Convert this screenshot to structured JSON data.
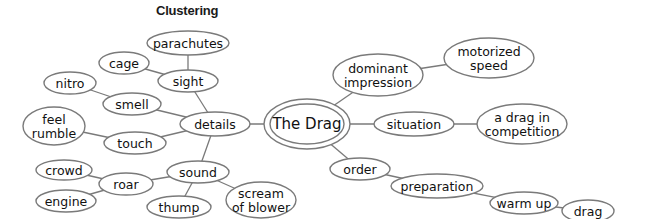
{
  "title": "Clustering",
  "center": {
    "id": "the-drag",
    "label": "The Drag",
    "cx": 307,
    "cy": 124,
    "rx": 43,
    "ry": 25,
    "inner_rx": 37,
    "inner_ry": 20
  },
  "colors": {
    "stroke": "#7a7a7a",
    "text": "#111111",
    "background": "#ffffff"
  },
  "nodes": [
    {
      "id": "details",
      "lines": [
        "details"
      ],
      "cx": 215,
      "cy": 124,
      "rx": 35,
      "ry": 12
    },
    {
      "id": "sight",
      "lines": [
        "sight"
      ],
      "cx": 188,
      "cy": 81,
      "rx": 30,
      "ry": 11
    },
    {
      "id": "parachutes",
      "lines": [
        "parachutes"
      ],
      "cx": 188,
      "cy": 43,
      "rx": 41,
      "ry": 12
    },
    {
      "id": "cage",
      "lines": [
        "cage"
      ],
      "cx": 124,
      "cy": 63,
      "rx": 25,
      "ry": 11
    },
    {
      "id": "smell",
      "lines": [
        "smell"
      ],
      "cx": 132,
      "cy": 104,
      "rx": 29,
      "ry": 11
    },
    {
      "id": "nitro",
      "lines": [
        "nitro"
      ],
      "cx": 70,
      "cy": 83,
      "rx": 26,
      "ry": 11
    },
    {
      "id": "touch",
      "lines": [
        "touch"
      ],
      "cx": 135,
      "cy": 143,
      "rx": 31,
      "ry": 11
    },
    {
      "id": "feel-rumble",
      "lines": [
        "feel",
        "rumble"
      ],
      "cx": 54,
      "cy": 126,
      "rx": 31,
      "ry": 19
    },
    {
      "id": "sound",
      "lines": [
        "sound"
      ],
      "cx": 198,
      "cy": 172,
      "rx": 31,
      "ry": 11
    },
    {
      "id": "roar",
      "lines": [
        "roar"
      ],
      "cx": 126,
      "cy": 184,
      "rx": 27,
      "ry": 11
    },
    {
      "id": "crowd",
      "lines": [
        "crowd"
      ],
      "cx": 64,
      "cy": 170,
      "rx": 28,
      "ry": 10
    },
    {
      "id": "engine",
      "lines": [
        "engine"
      ],
      "cx": 66,
      "cy": 201,
      "rx": 30,
      "ry": 11
    },
    {
      "id": "thump",
      "lines": [
        "thump"
      ],
      "cx": 179,
      "cy": 207,
      "rx": 32,
      "ry": 11
    },
    {
      "id": "scream-of-blower",
      "lines": [
        "scream",
        "of blower"
      ],
      "cx": 261,
      "cy": 200,
      "rx": 35,
      "ry": 18
    },
    {
      "id": "dominant-impression",
      "lines": [
        "dominant",
        "impression"
      ],
      "cx": 378,
      "cy": 75,
      "rx": 45,
      "ry": 21
    },
    {
      "id": "motorized-speed",
      "lines": [
        "motorized",
        "speed"
      ],
      "cx": 489,
      "cy": 58,
      "rx": 45,
      "ry": 20
    },
    {
      "id": "situation",
      "lines": [
        "situation"
      ],
      "cx": 414,
      "cy": 124,
      "rx": 40,
      "ry": 12
    },
    {
      "id": "a-drag-in-competition",
      "lines": [
        "a drag in",
        "competition"
      ],
      "cx": 522,
      "cy": 124,
      "rx": 45,
      "ry": 20
    },
    {
      "id": "order",
      "lines": [
        "order"
      ],
      "cx": 360,
      "cy": 169,
      "rx": 30,
      "ry": 11
    },
    {
      "id": "preparation",
      "lines": [
        "preparation"
      ],
      "cx": 437,
      "cy": 186,
      "rx": 46,
      "ry": 12
    },
    {
      "id": "warm-up",
      "lines": [
        "warm up"
      ],
      "cx": 524,
      "cy": 203,
      "rx": 34,
      "ry": 11
    },
    {
      "id": "drag",
      "lines": [
        "drag"
      ],
      "cx": 588,
      "cy": 211,
      "rx": 26,
      "ry": 11
    }
  ],
  "edges": [
    [
      "the-drag",
      "details"
    ],
    [
      "details",
      "sight"
    ],
    [
      "sight",
      "parachutes"
    ],
    [
      "sight",
      "cage"
    ],
    [
      "details",
      "smell"
    ],
    [
      "smell",
      "nitro"
    ],
    [
      "details",
      "touch"
    ],
    [
      "touch",
      "feel-rumble"
    ],
    [
      "details",
      "sound"
    ],
    [
      "sound",
      "roar"
    ],
    [
      "roar",
      "crowd"
    ],
    [
      "roar",
      "engine"
    ],
    [
      "sound",
      "thump"
    ],
    [
      "sound",
      "scream-of-blower"
    ],
    [
      "the-drag",
      "dominant-impression"
    ],
    [
      "dominant-impression",
      "motorized-speed"
    ],
    [
      "the-drag",
      "situation"
    ],
    [
      "situation",
      "a-drag-in-competition"
    ],
    [
      "the-drag",
      "order"
    ],
    [
      "order",
      "preparation"
    ],
    [
      "preparation",
      "warm-up"
    ],
    [
      "warm-up",
      "drag"
    ]
  ]
}
